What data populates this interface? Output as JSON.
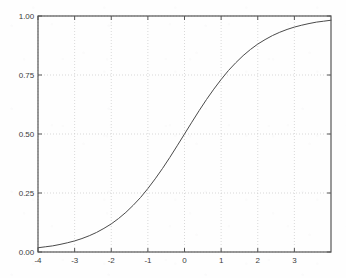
{
  "chart_data": {
    "type": "line",
    "title": "",
    "subtitle": "",
    "xlabel": "",
    "ylabel": "",
    "xlim": [
      -4,
      4
    ],
    "ylim": [
      0,
      1
    ],
    "grid": true,
    "grid_style": "dotted",
    "legend": null,
    "legend_position": "none",
    "x_ticks": [
      -4,
      -3,
      -2,
      -1,
      0,
      1,
      2,
      3
    ],
    "x_tick_labels": [
      "-4",
      "-3",
      "-2",
      "-1",
      "0",
      "1",
      "2",
      "3"
    ],
    "y_ticks": [
      0.0,
      0.25,
      0.5,
      0.75,
      1.0
    ],
    "y_tick_labels": [
      "0.00",
      "0.25",
      "0.50",
      "0.75",
      "1.00"
    ],
    "series": [
      {
        "name": "logistic sigmoid",
        "color": "#4a4a4a",
        "line_width": 1,
        "x": [
          -4.0,
          -3.8,
          -3.6,
          -3.4,
          -3.2,
          -3.0,
          -2.8,
          -2.6,
          -2.4,
          -2.2,
          -2.0,
          -1.8,
          -1.6,
          -1.4,
          -1.2,
          -1.0,
          -0.8,
          -0.6,
          -0.4,
          -0.2,
          0.0,
          0.2,
          0.4,
          0.6,
          0.8,
          1.0,
          1.2,
          1.4,
          1.6,
          1.8,
          2.0,
          2.2,
          2.4,
          2.6,
          2.8,
          3.0,
          3.2,
          3.4,
          3.6,
          3.8,
          4.0
        ],
        "y": [
          0.018,
          0.022,
          0.026,
          0.032,
          0.039,
          0.047,
          0.057,
          0.069,
          0.083,
          0.1,
          0.119,
          0.142,
          0.168,
          0.198,
          0.231,
          0.269,
          0.31,
          0.354,
          0.401,
          0.45,
          0.5,
          0.55,
          0.599,
          0.646,
          0.69,
          0.731,
          0.769,
          0.802,
          0.832,
          0.858,
          0.881,
          0.9,
          0.917,
          0.931,
          0.943,
          0.953,
          0.961,
          0.968,
          0.974,
          0.978,
          0.982
        ]
      }
    ],
    "annotations": []
  },
  "axes": {
    "frame_color": "#555555",
    "grid_color": "#c8c8c8",
    "background_color": "#fefefe",
    "tick_label_color": "#3b3b3b"
  }
}
